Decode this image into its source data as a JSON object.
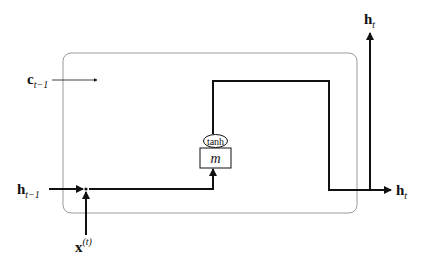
{
  "diagram": {
    "type": "rnn-cell",
    "cell_state_in": {
      "base": "c",
      "sub": "t−1"
    },
    "hidden_in": {
      "base": "h",
      "sub": "t−1"
    },
    "input": {
      "base": "x",
      "sup": "(t)"
    },
    "activation": "tanh",
    "memory_block": "m",
    "hidden_out_right": {
      "base": "h",
      "sub": "t"
    },
    "hidden_out_top": {
      "base": "h",
      "sub": "t"
    },
    "colors": {
      "line": "#111111",
      "frame": "#9a9a9a"
    }
  }
}
